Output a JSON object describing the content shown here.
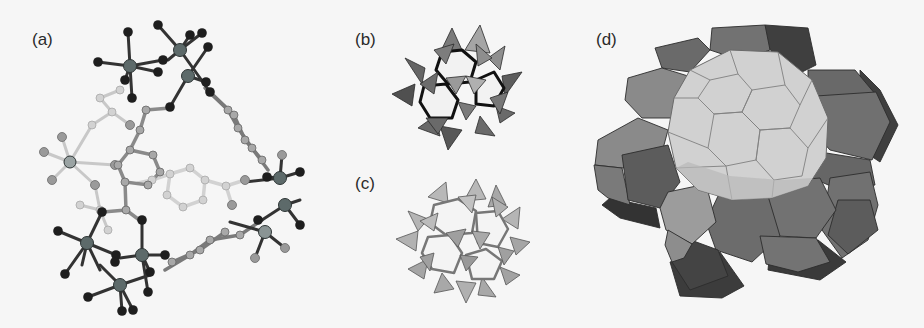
{
  "figure": {
    "panels": [
      {
        "id": "a",
        "label": "(a)",
        "content": "ball-and-stick molecular cage (triangular metal-organic macrocycle with octahedral metal centers and benzene-dicarboxylate linkers)"
      },
      {
        "id": "b",
        "label": "(b)",
        "content": "polyhedral cluster of corner-sharing tetrahedra, dark shading"
      },
      {
        "id": "c",
        "label": "(c)",
        "content": "polyhedral cluster of corner-sharing tetrahedra, light shading"
      },
      {
        "id": "d",
        "label": "(d)",
        "content": "space-filling tiling: central large polyhedral cage surrounded by pentagonal-dodecahedral cages"
      }
    ],
    "colors": {
      "background": "#f6f6f6",
      "atom_dark": "#1e1e1e",
      "atom_mid": "#6c6c6c",
      "atom_light": "#b9b9b9",
      "atom_pale": "#d4d4d4",
      "metal": "#5d6a6a",
      "tetra_dark": "#5a5a5a",
      "tetra_mid": "#8a8a8a",
      "tetra_light": "#b5b5b5",
      "cage_dark": "#4a4a4a",
      "cage_mid": "#7c7c7c",
      "cage_light": "#d0d0d0"
    }
  }
}
